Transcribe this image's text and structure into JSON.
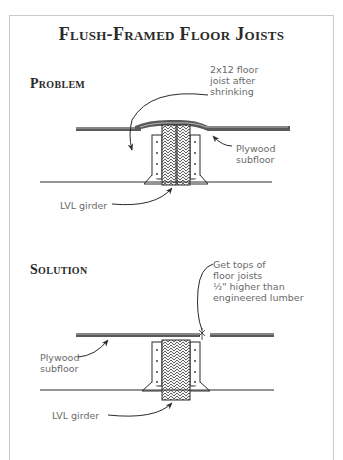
{
  "title": "Flush-Framed Floor Joists",
  "sections": {
    "problem": {
      "heading": "Problem",
      "labels": {
        "joist": "2x12 floor\njoist after\nshrinking",
        "plywood": "Plywood\nsubfloor",
        "girder": "LVL girder"
      }
    },
    "solution": {
      "heading": "Solution",
      "labels": {
        "note": "Get tops of\nfloor joists\n½\" higher than\nengineered lumber",
        "plywood": "Plywood\nsubfloor",
        "girder": "LVL girder"
      }
    }
  },
  "colors": {
    "ink": "#2a2a2a",
    "label": "#6a6a6a",
    "frame": "#c9c9c9"
  }
}
